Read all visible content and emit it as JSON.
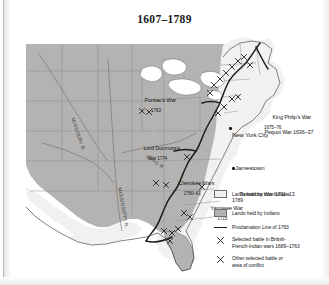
{
  "title": "1607–1789",
  "map": {
    "labels": [
      {
        "name": "pontiacs-war",
        "text": "Pontiac's War",
        "sub": "1763",
        "x": 112,
        "y": 57
      },
      {
        "name": "lord-dunmores-war",
        "text": "Lord Dunmore's",
        "sub": "War 1774",
        "x": 111,
        "y": 105
      },
      {
        "name": "king-philips-war",
        "text": "King Philip's War",
        "sub": "1675–76",
        "x": 240,
        "y": 74
      },
      {
        "name": "pequot-war",
        "text": "Pequot War 1636–37",
        "sub": "",
        "x": 232,
        "y": 89
      },
      {
        "name": "cherokee-wars",
        "text": "Cherokee Wars",
        "sub": "1760–61",
        "x": 146,
        "y": 140
      },
      {
        "name": "tuscarora-war",
        "text": "Tuscarora War 1711–13",
        "sub": "",
        "x": 207,
        "y": 151
      },
      {
        "name": "yamasee-war",
        "text": "Yamasee War",
        "sub": "1715",
        "x": 178,
        "y": 165
      }
    ],
    "cities": [
      {
        "name": "new-york-city",
        "text": "New York City",
        "x": 208,
        "y": 97,
        "dotx": 205,
        "doty": 92
      },
      {
        "name": "jamestown",
        "text": "Jamestown",
        "x": 211,
        "y": 133,
        "dotx": 208,
        "doty": 132
      }
    ],
    "rivers": [
      {
        "name": "missouri-river",
        "text": "MISSOURI R.",
        "x": 51,
        "y": 82,
        "rotate": 72
      },
      {
        "name": "ohio-river",
        "text": "OHIO R.",
        "x": 124,
        "y": 119,
        "rotate": 35
      },
      {
        "name": "mississippi-river",
        "text": "MISSISSIPPI R.",
        "x": 98,
        "y": 152,
        "rotate": 80
      }
    ]
  },
  "legend": {
    "items": [
      {
        "name": "legend-lands-non-indians",
        "key": "swatch-light",
        "line1": "Lands held by non-Indians",
        "line2": "1789"
      },
      {
        "name": "legend-lands-indians",
        "key": "swatch-dark",
        "line1": "Lands held by Indians",
        "line2": ""
      },
      {
        "name": "legend-proclamation-line",
        "key": "line",
        "line1": "Proclamation Line of 1763",
        "line2": ""
      },
      {
        "name": "legend-battle-british-french-indian",
        "key": "battle",
        "line1": "Selected battle in British-",
        "line2": "French-Indian wars 1689–1763"
      },
      {
        "name": "legend-battle-other",
        "key": "battle",
        "line1": "Other selected battle or",
        "line2": "area of conflict"
      }
    ]
  },
  "colors": {
    "indian_lands": "#b4b3b1",
    "non_indian_lands": "#f2f1ef",
    "proclamation_line": "#1d1d1d",
    "state_border": "#8d8c8a",
    "coast": "#575655",
    "text": "#171717",
    "page_background": "#ffffff"
  }
}
